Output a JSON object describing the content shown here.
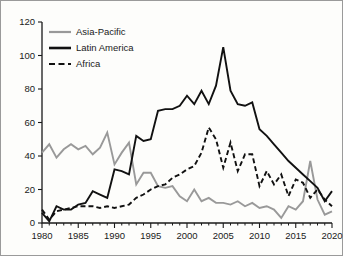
{
  "chart_data": {
    "type": "line",
    "title": "",
    "subtitle": "",
    "xlabel": "",
    "ylabel": "",
    "xlim": [
      1980,
      2020
    ],
    "ylim": [
      0,
      120
    ],
    "grid": false,
    "legend_position": "top-left",
    "xticks": [
      1980,
      1985,
      1990,
      1995,
      2000,
      2005,
      2010,
      2015,
      2020
    ],
    "xtick_labels": [
      "1980",
      "1985",
      "1990",
      "1995",
      "2000",
      "2005",
      "2010",
      "2015",
      "2020"
    ],
    "yticks": [
      0,
      20,
      40,
      60,
      80,
      100,
      120
    ],
    "ytick_labels": [
      "0",
      "20",
      "40",
      "60",
      "80",
      "100",
      "120"
    ],
    "x": [
      1980,
      1981,
      1982,
      1983,
      1984,
      1985,
      1986,
      1987,
      1988,
      1989,
      1990,
      1991,
      1992,
      1993,
      1994,
      1995,
      1996,
      1997,
      1998,
      1999,
      2000,
      2001,
      2002,
      2003,
      2004,
      2005,
      2006,
      2007,
      2008,
      2009,
      2010,
      2011,
      2012,
      2013,
      2014,
      2015,
      2016,
      2017,
      2018,
      2019,
      2020
    ],
    "series": [
      {
        "name": "Asia-Pacific",
        "color": "#999999",
        "style": "solid",
        "values": [
          42,
          47,
          39,
          44,
          47,
          44,
          46,
          41,
          45,
          54,
          35,
          42,
          48,
          23,
          30,
          30,
          22,
          21,
          22,
          16,
          13,
          20,
          13,
          15,
          12,
          12,
          11,
          13,
          10,
          12,
          9,
          10,
          8,
          3,
          10,
          8,
          13,
          37,
          14,
          5,
          7
        ]
      },
      {
        "name": "Latin America",
        "color": "#111111",
        "style": "solid",
        "values": [
          6,
          1,
          10,
          8,
          8,
          11,
          12,
          19,
          17,
          15,
          32,
          31,
          29,
          52,
          49,
          50,
          67,
          68,
          68,
          70,
          76,
          71,
          79,
          71,
          82,
          105,
          79,
          71,
          70,
          72,
          56,
          52,
          47,
          42,
          37,
          33,
          29,
          25,
          21,
          13,
          19
        ]
      },
      {
        "name": "Africa",
        "color": "#111111",
        "style": "dashed",
        "values": [
          8,
          2,
          7,
          8,
          9,
          10,
          10,
          10,
          9,
          10,
          9,
          10,
          11,
          15,
          17,
          20,
          22,
          23,
          27,
          29,
          32,
          34,
          42,
          57,
          50,
          33,
          48,
          31,
          41,
          41,
          22,
          31,
          23,
          29,
          16,
          26,
          24,
          15,
          20,
          14,
          10
        ]
      }
    ]
  },
  "legend": {
    "items": [
      {
        "label": "Asia-Pacific"
      },
      {
        "label": "Latin America"
      },
      {
        "label": "Africa"
      }
    ]
  }
}
